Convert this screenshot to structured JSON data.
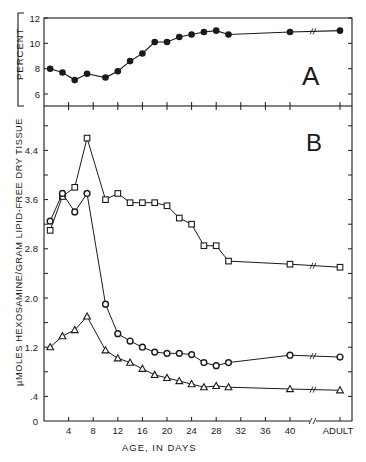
{
  "chart_data": [
    {
      "panel": "A",
      "type": "line",
      "title": "",
      "panel_label": "A",
      "xlabel": "AGE, IN DAYS",
      "ylabel": "PERCENT",
      "ylim": [
        5,
        12
      ],
      "yticks": [
        6,
        8,
        10,
        12
      ],
      "grid": false,
      "series": [
        {
          "name": "percent",
          "marker": "filled-circle",
          "x": [
            1,
            3,
            5,
            7,
            10,
            12,
            14,
            16,
            18,
            20,
            22,
            24,
            26,
            28,
            30,
            40,
            "ADULT"
          ],
          "values": [
            8.0,
            7.7,
            7.1,
            7.6,
            7.3,
            7.8,
            8.6,
            9.2,
            10.1,
            10.1,
            10.5,
            10.7,
            10.9,
            11.0,
            10.7,
            10.9,
            11.0
          ]
        }
      ]
    },
    {
      "panel": "B",
      "type": "line",
      "title": "",
      "panel_label": "B",
      "xlabel": "AGE, IN DAYS",
      "ylabel": "µMOLES HEXOSAMINE/GRAM LIPID-FREE DRY TISSUE",
      "ylim": [
        0,
        5.0
      ],
      "yticks": [
        0,
        0.4,
        1.2,
        2.0,
        2.8,
        3.6,
        4.4
      ],
      "ytick_labels": [
        "0",
        ".4",
        "1.2",
        "2.0",
        "2.8",
        "3.6",
        "4.4"
      ],
      "xticks": [
        4,
        8,
        12,
        16,
        20,
        24,
        28,
        32,
        36,
        40,
        "ADULT"
      ],
      "grid": false,
      "series": [
        {
          "name": "squares",
          "marker": "open-square",
          "x": [
            1,
            3,
            5,
            7,
            10,
            12,
            14,
            16,
            18,
            20,
            22,
            24,
            26,
            28,
            30,
            40,
            "ADULT"
          ],
          "values": [
            3.1,
            3.65,
            3.8,
            4.6,
            3.6,
            3.7,
            3.55,
            3.55,
            3.55,
            3.5,
            3.3,
            3.2,
            2.85,
            2.85,
            2.6,
            2.55,
            2.5
          ]
        },
        {
          "name": "circles",
          "marker": "open-circle",
          "x": [
            1,
            3,
            5,
            7,
            10,
            12,
            14,
            16,
            18,
            20,
            22,
            24,
            26,
            28,
            30,
            40,
            "ADULT"
          ],
          "values": [
            3.25,
            3.7,
            3.4,
            3.7,
            1.9,
            1.42,
            1.3,
            1.2,
            1.12,
            1.1,
            1.1,
            1.08,
            0.95,
            0.9,
            0.95,
            1.07,
            1.04
          ]
        },
        {
          "name": "triangles",
          "marker": "open-triangle",
          "x": [
            1,
            3,
            5,
            7,
            10,
            12,
            14,
            16,
            18,
            20,
            22,
            24,
            26,
            28,
            30,
            40,
            "ADULT"
          ],
          "values": [
            1.2,
            1.38,
            1.48,
            1.7,
            1.15,
            1.02,
            0.95,
            0.85,
            0.75,
            0.7,
            0.65,
            0.6,
            0.55,
            0.57,
            0.55,
            0.52,
            0.5
          ]
        }
      ]
    }
  ],
  "labels": {
    "panel_a": "A",
    "panel_b": "B",
    "ylabel_a": "PERCENT",
    "ylabel_b": "µMOLES HEXOSAMINE/GRAM LIPID-FREE DRY TISSUE",
    "xlabel": "AGE, IN DAYS",
    "adult": "ADULT"
  }
}
